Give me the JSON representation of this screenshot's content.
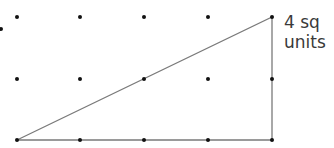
{
  "diagram": {
    "type": "dot-grid-triangle",
    "grid": {
      "columns_x": [
        17,
        80,
        144,
        208,
        272
      ],
      "rows_y": [
        17,
        79,
        140
      ],
      "partial_dot": {
        "x": 1,
        "y": 29
      },
      "dot_color": "#111111",
      "dot_radius": 2
    },
    "triangle": {
      "vertices": [
        [
          17,
          140
        ],
        [
          272,
          17
        ],
        [
          272,
          140
        ]
      ],
      "stroke_color": "#7a7a7a",
      "stroke_width": 1.3
    },
    "label": {
      "line1": "4 sq",
      "line2": "units",
      "color": "#3a3a3a"
    }
  }
}
